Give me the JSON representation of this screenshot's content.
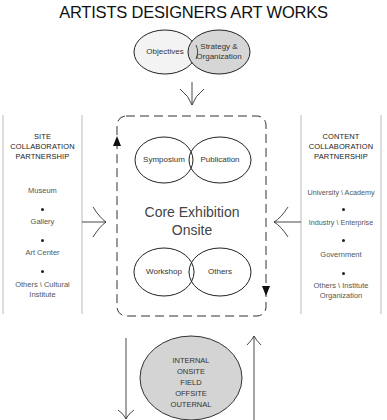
{
  "title": "ARTISTS DESIGNERS ART WORKS",
  "top_circles": {
    "left": {
      "label": "Objectives",
      "fill": "#f2f2f2"
    },
    "right": {
      "label_line1": "Strategy &",
      "label_line2": "Organization",
      "fill": "#d6d6d6"
    }
  },
  "left_panel": {
    "title_line1": "SITE",
    "title_line2": "COLLABORATION",
    "title_line3": "PARTNERSHIP",
    "items": [
      "Museum",
      "Gallery",
      "Art Center",
      "Others \\ Cultural",
      "Institute"
    ]
  },
  "right_panel": {
    "title_line1": "CONTENT",
    "title_line2": "COLLABORATION",
    "title_line3": "PARTNERSHIP",
    "items": [
      "University \\ Academy",
      "Industry \\ Enterprise",
      "Government",
      "Others \\ Institute",
      "Organization"
    ]
  },
  "core": {
    "title_line1": "Core Exhibition",
    "title_line2": "Onsite",
    "top_circles": [
      "Symposium",
      "Publication"
    ],
    "bottom_circles": [
      "Workshop",
      "Others"
    ]
  },
  "bottom_circle": {
    "fill": "#d4d4d4",
    "lines": [
      "INTERNAL",
      "ONSITE",
      "FIELD",
      "OFFSITE",
      "OUTERNAL"
    ]
  }
}
